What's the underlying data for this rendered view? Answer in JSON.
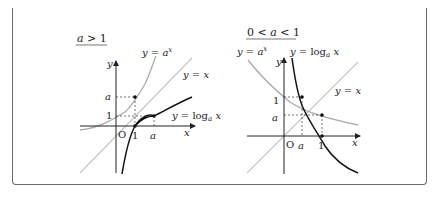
{
  "figure": {
    "left": {
      "title": "a > 1",
      "exp_label": "y = a^x",
      "identity_label": "y = x",
      "log_label": "y = log_a x",
      "y_axis": "y",
      "x_axis": "x",
      "origin": "O",
      "tick_y_a": "a",
      "tick_y_1": "1",
      "tick_x_1": "1",
      "tick_x_a": "a"
    },
    "right": {
      "title": "0 < a < 1",
      "exp_label": "y = a^x",
      "identity_label": "y = x",
      "log_label": "y = log_a x",
      "y_axis": "y",
      "x_axis": "x",
      "origin": "O",
      "tick_y_1": "1",
      "tick_y_a": "a",
      "tick_x_a": "a",
      "tick_x_1": "1"
    },
    "colors": {
      "exp_curve": "#aaaaaa",
      "identity_line": "#c8c8c8",
      "log_curve": "#111111",
      "axes": "#222222",
      "border": "#6a6a6a"
    }
  }
}
